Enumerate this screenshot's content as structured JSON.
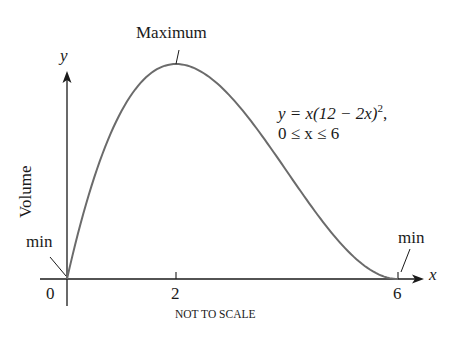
{
  "chart_data": {
    "type": "line",
    "title": "",
    "function": "y = x(12 - 2x)^2",
    "domain_text": "0 ≤ x ≤ 6",
    "x": [
      0,
      0.5,
      1,
      1.5,
      2,
      2.5,
      3,
      3.5,
      4,
      4.5,
      5,
      5.5,
      6
    ],
    "values": [
      0,
      60.5,
      100,
      121.5,
      128,
      122.5,
      108,
      87.5,
      64,
      40.5,
      20,
      5.5,
      0
    ],
    "xlabel": "x",
    "ylabel": "y",
    "y_axis_title": "Volume",
    "x_ticks": [
      "0",
      "2",
      "6"
    ],
    "xlim": [
      0,
      6
    ],
    "ylim": [
      0,
      128
    ],
    "grid": false,
    "legend": "none",
    "annotations": [
      {
        "text": "Maximum",
        "x": 2,
        "y": 128
      },
      {
        "text": "min",
        "x": 0,
        "y": 0
      },
      {
        "text": "min",
        "x": 6,
        "y": 0
      }
    ],
    "footnote": "NOT TO SCALE"
  },
  "labels": {
    "maximum": "Maximum",
    "min_left": "min",
    "min_right": "min",
    "y_axis_var": "y",
    "x_axis_var": "x",
    "y_axis_title": "Volume",
    "tick_0": "0",
    "tick_2": "2",
    "tick_6": "6",
    "equation_line1": "y = x(12 − 2x)",
    "equation_exp": "2",
    "equation_comma": ",",
    "equation_line2": "0 ≤ x ≤ 6",
    "not_to_scale": "NOT TO SCALE"
  },
  "colors": {
    "curve": "#6b6b6b",
    "axes": "#1a1a1a"
  }
}
